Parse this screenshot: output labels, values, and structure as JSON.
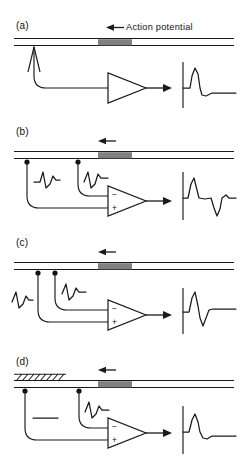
{
  "figure": {
    "type": "scientific-diagram",
    "background": "#ffffff",
    "ink_color": "#1a1a1a",
    "ap_block_color": "#808080",
    "annotation": {
      "action_potential_label": "Action potential",
      "propagation_direction": "leftward"
    },
    "panels": [
      {
        "id": "a",
        "label": "(a)",
        "recording_mode": "monopolar",
        "electrodes": [
          {
            "name": "probe",
            "style": "hollow-arrowhead",
            "local_trace": "none"
          }
        ],
        "amplifier": {
          "type": "single-ended",
          "inputs": []
        },
        "crush": false,
        "output_trace": "monophasic",
        "output_description": "single upward spike with small undershoot"
      },
      {
        "id": "b",
        "label": "(b)",
        "recording_mode": "bipolar-wide",
        "electrodes": [
          {
            "name": "electrode-1",
            "style": "dot",
            "local_trace": "biphasic"
          },
          {
            "name": "electrode-2",
            "style": "dot",
            "local_trace": "biphasic"
          }
        ],
        "amplifier": {
          "type": "differential",
          "inputs": [
            "−",
            "+"
          ]
        },
        "crush": false,
        "output_trace": "biphasic-separated",
        "output_description": "upward spike followed after a delay by a downward deflection"
      },
      {
        "id": "c",
        "label": "(c)",
        "recording_mode": "bipolar-narrow",
        "electrodes": [
          {
            "name": "electrode-1",
            "style": "dot",
            "local_trace": "biphasic"
          },
          {
            "name": "electrode-2",
            "style": "dot",
            "local_trace": "biphasic"
          }
        ],
        "amplifier": {
          "type": "differential",
          "inputs": [
            "−",
            "+"
          ]
        },
        "crush": false,
        "output_trace": "biphasic-adjacent",
        "output_description": "upward spike immediately followed by downward deflection"
      },
      {
        "id": "d",
        "label": "(d)",
        "recording_mode": "bipolar-with-crush",
        "electrodes": [
          {
            "name": "electrode-1",
            "style": "dot",
            "local_trace": "flat"
          },
          {
            "name": "electrode-2",
            "style": "dot",
            "local_trace": "biphasic"
          }
        ],
        "amplifier": {
          "type": "differential",
          "inputs": [
            "−",
            "+"
          ]
        },
        "crush": true,
        "crush_marking": "diagonal-hatching",
        "output_trace": "monophasic",
        "output_description": "single upward spike with small undershoot"
      }
    ]
  }
}
